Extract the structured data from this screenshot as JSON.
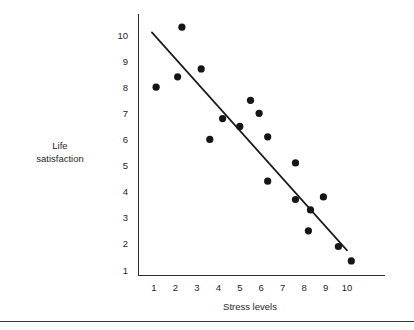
{
  "chart_data": {
    "type": "scatter",
    "title": "",
    "xlabel": "Stress levels",
    "ylabel": "Life satisfaction",
    "ylabel_lines": [
      "Life",
      "satisfaction"
    ],
    "xlim": [
      0.35,
      10.85
    ],
    "ylim": [
      0.55,
      10.75
    ],
    "xticks": [
      1,
      2,
      3,
      4,
      5,
      6,
      7,
      8,
      9,
      10
    ],
    "yticks": [
      1,
      2,
      3,
      4,
      5,
      6,
      7,
      8,
      9,
      10
    ],
    "xtick_labels": [
      "1",
      "2",
      "3",
      "4",
      "5",
      "6",
      "7",
      "8",
      "9",
      "10"
    ],
    "ytick_labels": [
      "1",
      "2",
      "3",
      "4",
      "5",
      "6",
      "7",
      "8",
      "9",
      "10"
    ],
    "grid": false,
    "legend": false,
    "marker_color": "#151515",
    "line_color": "#1a1a1a",
    "axis_color": "#2b2b2b",
    "points": [
      {
        "x": 1.1,
        "y": 8.0
      },
      {
        "x": 2.1,
        "y": 8.4
      },
      {
        "x": 2.3,
        "y": 10.3
      },
      {
        "x": 3.2,
        "y": 8.7
      },
      {
        "x": 3.6,
        "y": 6.0
      },
      {
        "x": 4.2,
        "y": 6.8
      },
      {
        "x": 5.0,
        "y": 6.5
      },
      {
        "x": 5.5,
        "y": 7.5
      },
      {
        "x": 5.9,
        "y": 7.0
      },
      {
        "x": 6.3,
        "y": 6.1
      },
      {
        "x": 6.3,
        "y": 4.4
      },
      {
        "x": 7.6,
        "y": 5.1
      },
      {
        "x": 7.6,
        "y": 3.7
      },
      {
        "x": 8.2,
        "y": 2.5
      },
      {
        "x": 8.3,
        "y": 3.3
      },
      {
        "x": 8.9,
        "y": 3.8
      },
      {
        "x": 9.6,
        "y": 1.9
      },
      {
        "x": 10.2,
        "y": 1.35
      }
    ],
    "trend_line": {
      "name": "line of best fit",
      "x0": 0.9,
      "y0": 10.1,
      "x1": 10.0,
      "y1": 1.75
    }
  }
}
